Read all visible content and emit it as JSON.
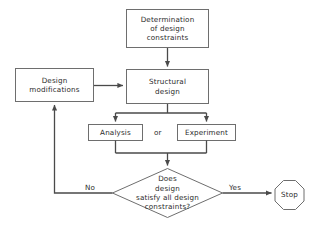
{
  "diagram": {
    "colors": {
      "stroke": "#6e6e6e",
      "stroke_dark": "#4a4a4a",
      "text": "#2b2b2b",
      "background": "#ffffff"
    },
    "nodes": [
      {
        "id": "determination",
        "shape": "rectangle",
        "label": "Determination\nof design\nconstraints"
      },
      {
        "id": "structural-design",
        "shape": "rectangle",
        "label": "Structural\ndesign"
      },
      {
        "id": "design-modifications",
        "shape": "rectangle",
        "label": "Design\nmodifications"
      },
      {
        "id": "analysis",
        "shape": "rectangle",
        "label": "Analysis"
      },
      {
        "id": "experiment",
        "shape": "rectangle",
        "label": "Experiment"
      },
      {
        "id": "decision",
        "shape": "diamond",
        "label": "Does\ndesign\nsatisfy all design\nconstraints?"
      },
      {
        "id": "stop",
        "shape": "octagon",
        "label": "Stop"
      }
    ],
    "edge_labels": {
      "or": "or",
      "no": "No",
      "yes": "Yes"
    }
  }
}
